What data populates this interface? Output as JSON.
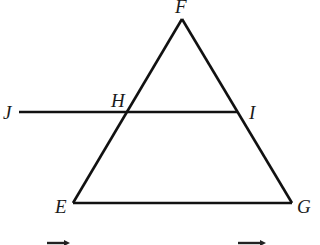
{
  "diagram": {
    "colors": {
      "stroke": "#111111",
      "label": "#1a1a1a",
      "background": "#ffffff"
    },
    "points": {
      "F": {
        "label": "F",
        "x": 182,
        "y": 19
      },
      "H": {
        "label": "H",
        "x": 128,
        "y": 112
      },
      "I": {
        "label": "I",
        "x": 238,
        "y": 112
      },
      "J": {
        "label": "J",
        "x": 19,
        "y": 112
      },
      "E": {
        "label": "E",
        "x": 73,
        "y": 203
      },
      "G": {
        "label": "G",
        "x": 292,
        "y": 203
      }
    },
    "segments": [
      {
        "name": "FE",
        "from": "F",
        "to": "E"
      },
      {
        "name": "FG",
        "from": "F",
        "to": "G"
      },
      {
        "name": "EG",
        "from": "E",
        "to": "G"
      },
      {
        "name": "JI",
        "from": "J",
        "to": "I"
      }
    ],
    "labels": {
      "F": "F",
      "H": "H",
      "I": "I",
      "J": "J",
      "E": "E",
      "G": "G"
    },
    "bottom_notation": [
      {
        "type": "overline-arrow",
        "x1": 47,
        "x2": 68,
        "y": 242
      },
      {
        "type": "overline-arrow",
        "x1": 238,
        "x2": 265,
        "y": 242
      }
    ]
  }
}
